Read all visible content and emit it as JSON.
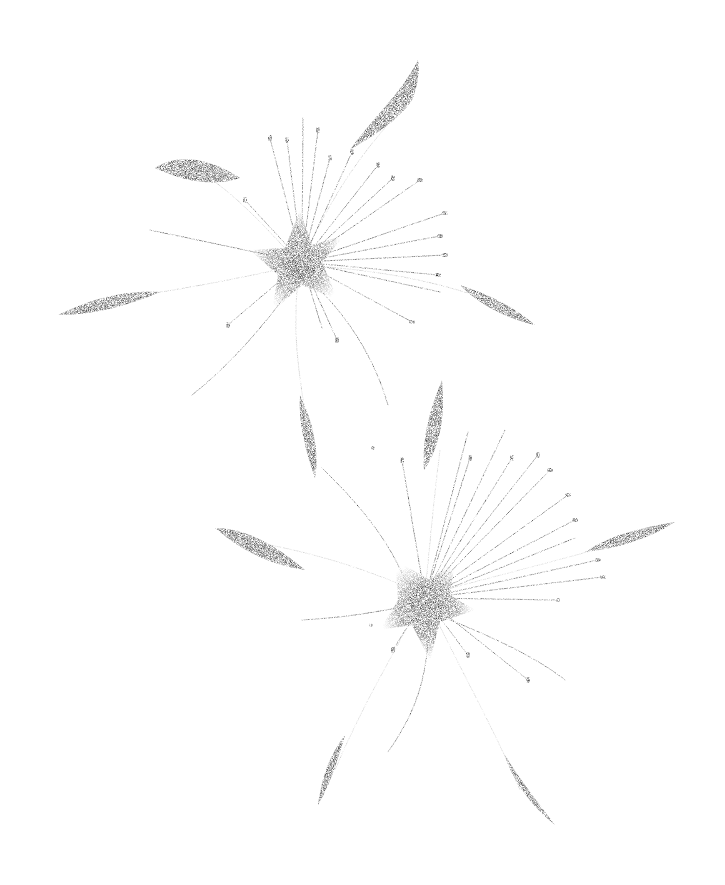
{
  "image": {
    "description": "Graphite pencil illustration of two star-shaped flowers with five slender petals and many long thread-like stamens on a white background",
    "background": "#ffffff",
    "ink": "#1a1a1a",
    "subjects": [
      {
        "name": "upper-flower",
        "center": [
          300,
          265
        ],
        "petals": 5
      },
      {
        "name": "lower-flower",
        "center": [
          425,
          595
        ],
        "petals": 5
      }
    ]
  }
}
